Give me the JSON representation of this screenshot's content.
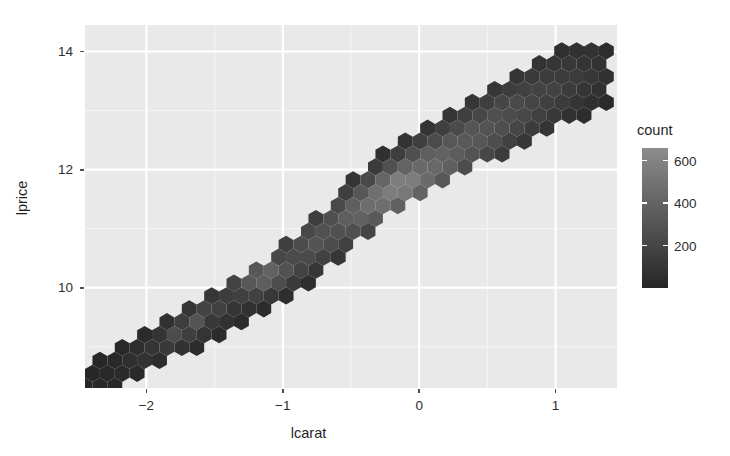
{
  "chart_data": {
    "type": "heatmap",
    "subtype": "hexbin",
    "title": "",
    "xlabel": "lcarat",
    "ylabel": "lprice",
    "xlim": [
      -2.45,
      1.45
    ],
    "ylim": [
      8.3,
      14.45
    ],
    "xticks": [
      -2,
      -1,
      0,
      1
    ],
    "xticklabels": [
      "−2",
      "−1",
      "0",
      "1"
    ],
    "yticks": [
      10,
      12,
      14
    ],
    "yticklabels": [
      "10",
      "12",
      "14"
    ],
    "grid": true,
    "grid_major_color": "#ffffff",
    "grid_minor_color": "#f4f4f4",
    "panel_background": "#e9e9e9",
    "plot_background": "#ffffff",
    "legend": {
      "position": "right",
      "title": "count",
      "ticks": [
        200,
        400,
        600
      ],
      "ticklabels": [
        "200",
        "400",
        "600"
      ],
      "range": [
        0,
        660
      ],
      "low_color": "#262626",
      "high_color": "#8c8c8c"
    },
    "hex_size_px": 8.6,
    "bins": [
      {
        "x": -2.36,
        "y": 8.55,
        "count": 12
      },
      {
        "x": -2.3,
        "y": 8.45,
        "count": 7
      },
      {
        "x": -2.24,
        "y": 8.62,
        "count": 22
      },
      {
        "x": -2.18,
        "y": 8.52,
        "count": 31
      },
      {
        "x": -2.18,
        "y": 8.72,
        "count": 40
      },
      {
        "x": -2.12,
        "y": 8.62,
        "count": 52
      },
      {
        "x": -2.12,
        "y": 8.8,
        "count": 61
      },
      {
        "x": -2.06,
        "y": 8.55,
        "count": 44
      },
      {
        "x": -2.06,
        "y": 8.72,
        "count": 74
      },
      {
        "x": -2.06,
        "y": 8.9,
        "count": 66
      },
      {
        "x": -2.0,
        "y": 8.64,
        "count": 58
      },
      {
        "x": -2.0,
        "y": 8.82,
        "count": 95
      },
      {
        "x": -2.0,
        "y": 9.0,
        "count": 88
      },
      {
        "x": -1.94,
        "y": 8.74,
        "count": 70
      },
      {
        "x": -1.94,
        "y": 8.92,
        "count": 120
      },
      {
        "x": -1.94,
        "y": 9.1,
        "count": 104
      },
      {
        "x": -1.88,
        "y": 8.84,
        "count": 86
      },
      {
        "x": -1.88,
        "y": 9.02,
        "count": 155
      },
      {
        "x": -1.88,
        "y": 9.2,
        "count": 132
      },
      {
        "x": -1.82,
        "y": 8.94,
        "count": 112
      },
      {
        "x": -1.82,
        "y": 9.12,
        "count": 210
      },
      {
        "x": -1.82,
        "y": 9.3,
        "count": 168
      },
      {
        "x": -1.76,
        "y": 9.04,
        "count": 138
      },
      {
        "x": -1.76,
        "y": 9.22,
        "count": 265
      },
      {
        "x": -1.76,
        "y": 9.4,
        "count": 190
      },
      {
        "x": -1.7,
        "y": 9.14,
        "count": 160
      },
      {
        "x": -1.7,
        "y": 9.32,
        "count": 340
      },
      {
        "x": -1.7,
        "y": 9.5,
        "count": 205
      },
      {
        "x": -1.64,
        "y": 9.26,
        "count": 175
      },
      {
        "x": -1.64,
        "y": 9.44,
        "count": 300
      },
      {
        "x": -1.64,
        "y": 9.62,
        "count": 190
      },
      {
        "x": -1.58,
        "y": 9.38,
        "count": 160
      },
      {
        "x": -1.58,
        "y": 9.56,
        "count": 245
      },
      {
        "x": -1.52,
        "y": 9.48,
        "count": 140
      },
      {
        "x": -1.52,
        "y": 9.66,
        "count": 185
      },
      {
        "x": -1.4,
        "y": 9.7,
        "count": 120
      },
      {
        "x": -1.34,
        "y": 9.82,
        "count": 150
      },
      {
        "x": -1.28,
        "y": 9.94,
        "count": 230
      },
      {
        "x": -1.22,
        "y": 10.06,
        "count": 330
      },
      {
        "x": -1.16,
        "y": 10.18,
        "count": 420
      },
      {
        "x": -1.1,
        "y": 10.28,
        "count": 390
      },
      {
        "x": -1.04,
        "y": 10.4,
        "count": 300
      },
      {
        "x": -0.98,
        "y": 10.52,
        "count": 240
      },
      {
        "x": -0.6,
        "y": 10.95,
        "count": 280
      },
      {
        "x": -0.54,
        "y": 11.05,
        "count": 340
      },
      {
        "x": -0.48,
        "y": 11.15,
        "count": 380
      },
      {
        "x": -0.42,
        "y": 11.25,
        "count": 420
      },
      {
        "x": -0.36,
        "y": 11.35,
        "count": 460
      },
      {
        "x": -0.3,
        "y": 11.45,
        "count": 500
      },
      {
        "x": -0.24,
        "y": 11.55,
        "count": 540
      },
      {
        "x": -0.18,
        "y": 11.65,
        "count": 580
      },
      {
        "x": -0.12,
        "y": 11.75,
        "count": 610
      },
      {
        "x": -0.06,
        "y": 11.85,
        "count": 560
      },
      {
        "x": 0.0,
        "y": 11.95,
        "count": 480
      },
      {
        "x": 0.06,
        "y": 12.05,
        "count": 430
      },
      {
        "x": 0.3,
        "y": 12.4,
        "count": 360
      },
      {
        "x": 0.36,
        "y": 12.5,
        "count": 330
      },
      {
        "x": 0.6,
        "y": 12.85,
        "count": 280
      },
      {
        "x": 0.66,
        "y": 12.95,
        "count": 240
      },
      {
        "x": 0.9,
        "y": 13.3,
        "count": 190
      },
      {
        "x": 1.1,
        "y": 13.6,
        "count": 140
      },
      {
        "x": 1.25,
        "y": 13.9,
        "count": 90
      },
      {
        "x": 1.35,
        "y": 14.1,
        "count": 45
      }
    ]
  },
  "axes": {
    "x": {
      "title": "lcarat",
      "ticks": [
        {
          "label": "−2",
          "value": -2
        },
        {
          "label": "−1",
          "value": -1
        },
        {
          "label": "0",
          "value": 0
        },
        {
          "label": "1",
          "value": 1
        }
      ]
    },
    "y": {
      "title": "lprice",
      "ticks": [
        {
          "label": "14",
          "value": 14
        },
        {
          "label": "12",
          "value": 12
        },
        {
          "label": "10",
          "value": 10
        }
      ]
    }
  },
  "legend": {
    "title": "count",
    "labels": [
      {
        "label": "600",
        "value": 600
      },
      {
        "label": "400",
        "value": 400
      },
      {
        "label": "200",
        "value": 200
      }
    ]
  }
}
